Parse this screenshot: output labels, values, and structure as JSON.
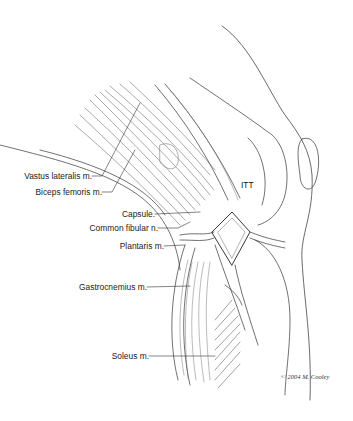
{
  "figure": {
    "labels": [
      {
        "id": "vastus_lateralis",
        "text": "Vastus lateralis m."
      },
      {
        "id": "biceps_femoris",
        "text": "Biceps femoris m."
      },
      {
        "id": "capsule",
        "text": "Capsule."
      },
      {
        "id": "common_fibular",
        "text": "Common fibular n."
      },
      {
        "id": "plantaris",
        "text": "Plantaris m."
      },
      {
        "id": "gastrocnemius",
        "text": "Gastrocnemius m."
      },
      {
        "id": "soleus",
        "text": "Soleus m."
      }
    ],
    "itt_label": "ITT",
    "credit": "© 2004 M. Cooley"
  }
}
